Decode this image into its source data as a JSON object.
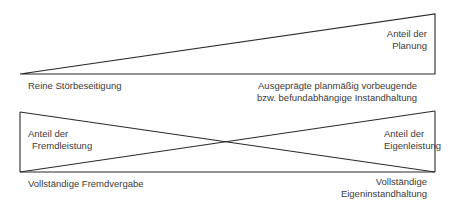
{
  "top_diagram": {
    "label_planning": [
      "Anteil der",
      "Planung"
    ],
    "left_caption": "Reine Störbeseitigung",
    "right_caption": [
      "Ausgeprägte planmäßig vorbeugende",
      "bzw. befundabhängige  Instandhaltung"
    ]
  },
  "bottom_diagram": {
    "label_external": [
      "Anteil der",
      "Fremdleistung"
    ],
    "label_internal": [
      "Anteil der",
      "Eigenleistung"
    ],
    "left_caption": "Vollständige Fremdvergabe",
    "right_caption": [
      "Vollständige",
      "Eigeninstandhaltung"
    ]
  },
  "colors": {
    "line": "#2a2a2a",
    "text": "#3a3a3a"
  }
}
